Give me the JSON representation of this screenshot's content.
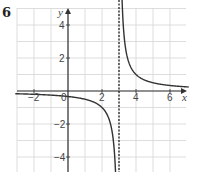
{
  "question_number": "6",
  "chart_data": {
    "type": "line",
    "title": "",
    "xlabel": "x",
    "ylabel": "y",
    "xlim": [
      -3,
      7
    ],
    "ylim": [
      -5,
      5
    ],
    "grid": true,
    "x_ticks": [
      {
        "value": -2,
        "label": "−2"
      },
      {
        "value": 0,
        "label": "0"
      },
      {
        "value": 2,
        "label": "2"
      },
      {
        "value": 4,
        "label": "4"
      },
      {
        "value": 6,
        "label": "6"
      }
    ],
    "y_ticks": [
      {
        "value": 4,
        "label": "4"
      },
      {
        "value": 2,
        "label": "2"
      },
      {
        "value": -2,
        "label": "−2"
      },
      {
        "value": -4,
        "label": "−4"
      }
    ],
    "function": "y = 1/(x - 3)",
    "asymptotes": [
      {
        "type": "vertical",
        "x": 3,
        "style": "dashed"
      },
      {
        "type": "horizontal",
        "y": 0
      }
    ],
    "series": [
      {
        "name": "left-branch",
        "x": [
          -3,
          -2,
          -1,
          0,
          1,
          2,
          2.5,
          2.8
        ],
        "y": [
          -0.17,
          -0.2,
          -0.25,
          -0.33,
          -0.5,
          -1,
          -2,
          -5
        ]
      },
      {
        "name": "right-branch",
        "x": [
          3.2,
          3.5,
          4,
          5,
          6,
          7
        ],
        "y": [
          5,
          2,
          1,
          0.5,
          0.33,
          0.25
        ]
      }
    ]
  }
}
